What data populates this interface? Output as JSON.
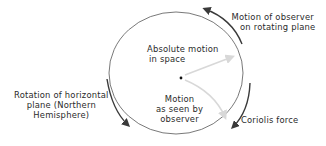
{
  "diagram": {
    "labels": {
      "observer_motion": [
        "Motion of observer",
        "on rotating plane"
      ],
      "absolute_motion": [
        "Absolute motion",
        "in space"
      ],
      "seen_motion": [
        "Motion",
        "as seen by",
        "observer"
      ],
      "rotation": [
        "Rotation of horizontal",
        "plane (Northern",
        "Hemisphere)"
      ],
      "coriolis": [
        "Coriolis force"
      ]
    },
    "colors": {
      "circle": "#6a6a6a",
      "dark_arrow": "#3a3a3a",
      "light_arrow": "#d8d8d8",
      "text": "#2a2a2a"
    }
  }
}
